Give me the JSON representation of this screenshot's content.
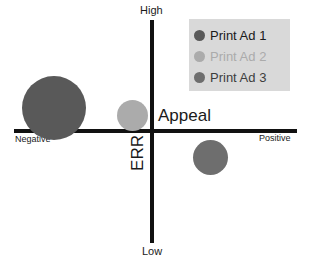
{
  "chart_data": {
    "type": "scatter",
    "title": "",
    "subtitle": "",
    "xlabel": "Appeal",
    "ylabel": "ERR",
    "x_axis": {
      "label": "Appeal",
      "low_tick": "Negative",
      "high_tick": "Positive"
    },
    "y_axis": {
      "label": "ERR",
      "low_tick": "Low",
      "high_tick": "High"
    },
    "grid": false,
    "legend_position": "top-right",
    "quadrant_chart": true,
    "series": [
      {
        "name": "Print Ad 1",
        "color": "#595959",
        "appeal": "Negative",
        "err": "High",
        "x": -0.92,
        "y": 0.16,
        "size": 64,
        "px": {
          "cx": 54,
          "cy": 108,
          "d": 64
        }
      },
      {
        "name": "Print Ad 2",
        "color": "#ababab",
        "appeal": "Negative",
        "err": "High",
        "x": -0.23,
        "y": 0.12,
        "size": 31,
        "px": {
          "cx": 132,
          "cy": 115,
          "d": 31
        }
      },
      {
        "name": "Print Ad 3",
        "color": "#6e6e6e",
        "appeal": "Positive",
        "err": "Low",
        "x": 0.41,
        "y": -0.23,
        "size": 35,
        "px": {
          "cx": 210,
          "cy": 157,
          "d": 35
        }
      }
    ]
  },
  "legend": {
    "background": "#d9d9d9",
    "items": [
      {
        "label": "Print Ad 1",
        "color": "#595959",
        "text_color": "#1a1a1a"
      },
      {
        "label": "Print Ad 2",
        "color": "#ababab",
        "text_color": "#ababab"
      },
      {
        "label": "Print Ad 3",
        "color": "#6e6e6e",
        "text_color": "#3d3d3d"
      }
    ]
  },
  "axes": {
    "high": "High",
    "low": "Low",
    "negative": "Negative",
    "positive": "Positive",
    "appeal": "Appeal",
    "err": "ERR",
    "color": "#111111"
  }
}
